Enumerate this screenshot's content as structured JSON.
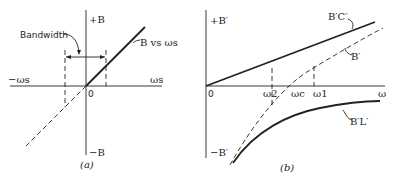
{
  "figure_a": {
    "caption": "(a)",
    "y_top_label": "+B",
    "y_bottom_label": "−B",
    "x_left_label": "−ωs",
    "x_right_label": "ωs",
    "origin_label": "0",
    "bandwidth_label": "Bandwidth",
    "line_label": "B vs ωs"
  },
  "figure_b": {
    "caption": "(b)",
    "y_top_label": "+B′",
    "y_bottom_label": "−B′",
    "x_right_label": "ω",
    "origin_label": "0",
    "omega2_label": "ω2",
    "omegac_label": "ωc",
    "omega1_label": "ω1",
    "bc_label": "B′C′",
    "b_label": "B′",
    "bl_label": "B′L′"
  },
  "colors": {
    "stroke": "#222222",
    "background": "#ffffff"
  }
}
